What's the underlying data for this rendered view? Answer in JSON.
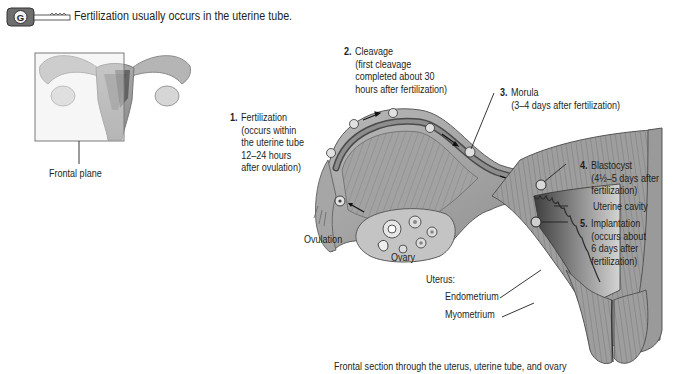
{
  "header": {
    "icon": "key-icon",
    "text": "Fertilization usually occurs in the uterine tube."
  },
  "thumbnail": {
    "label": "Frontal plane"
  },
  "labels": {
    "step1": {
      "num": "1.",
      "lines": [
        "Fertilization",
        "(occurs within",
        "the uterine tube",
        "12–24 hours",
        "after ovulation)"
      ]
    },
    "step2": {
      "num": "2.",
      "lines": [
        "Cleavage",
        "(first cleavage",
        "completed about 30",
        "hours after fertilization)"
      ]
    },
    "step3": {
      "num": "3.",
      "lines": [
        "Morula",
        "(3–4 days after fertilization)"
      ]
    },
    "step4": {
      "num": "4.",
      "lines": [
        "Blastocyst",
        "(4½–5 days after",
        "fertilization)"
      ]
    },
    "uterine_cavity": "Uterine cavity",
    "step5": {
      "num": "5.",
      "lines": [
        "Implantation",
        "(occurs about",
        "6 days after",
        "fertilization)"
      ]
    },
    "ovulation": "Ovulation",
    "ovary": "Ovary",
    "uterus": "Uterus:",
    "endometrium": "Endometrium",
    "myometrium": "Myometrium"
  },
  "caption": "Frontal section through the uterus, uterine tube, and ovary",
  "colors": {
    "tissue_light": "#c9c9c9",
    "tissue_mid": "#9a9a9a",
    "tissue_dark": "#5c5c5c",
    "cavity": "#7a7a7a",
    "text": "#231f20"
  }
}
